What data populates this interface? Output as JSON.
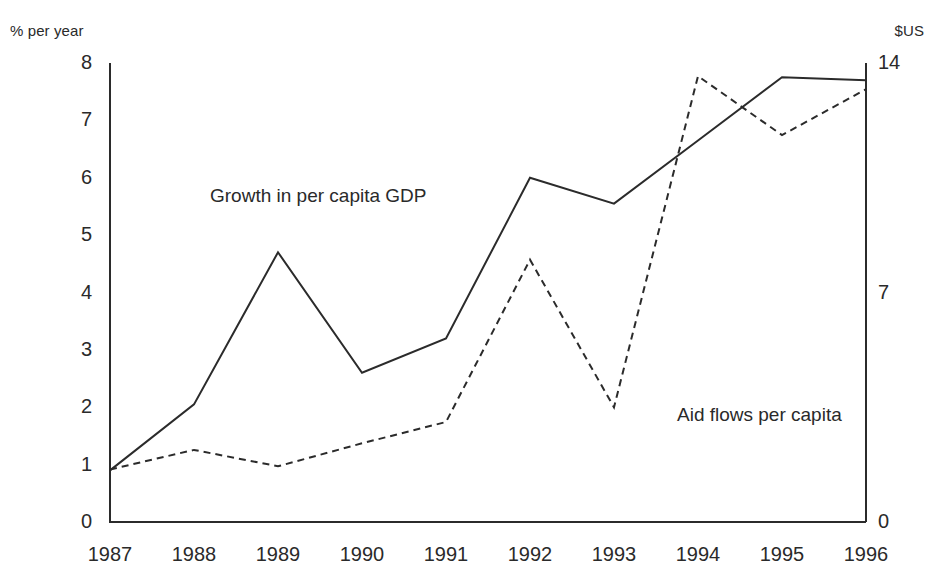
{
  "chart_data": {
    "type": "line",
    "title": "",
    "subtitle": "",
    "xlabel": "",
    "ylabel": "% per year",
    "y2label": "$US",
    "grid": false,
    "legend_position": "inline-annotations",
    "x": [
      "1987",
      "1988",
      "1989",
      "1990",
      "1991",
      "1992",
      "1993",
      "1994",
      "1995",
      "1996"
    ],
    "xtick_labels": [
      "1987",
      "1988",
      "1989",
      "1990",
      "1991",
      "1992",
      "1993",
      "1994",
      "1995",
      "1996"
    ],
    "ytick_labels_left": [
      "8",
      "7",
      "6",
      "5",
      "4",
      "3",
      "2",
      "1",
      "0"
    ],
    "ytick_values_left": [
      8,
      7,
      6,
      5,
      4,
      3,
      2,
      1,
      0
    ],
    "ytick_labels_right": [
      "14",
      "7",
      "0"
    ],
    "ytick_values_right": [
      14,
      7,
      0
    ],
    "ylim_left": [
      0,
      8
    ],
    "ylim_right": [
      0,
      14
    ],
    "series": [
      {
        "name": "Growth in per capita GDP",
        "axis": "left",
        "style": "solid",
        "unit": "% per year",
        "values": [
          0.9,
          2.05,
          4.7,
          2.6,
          3.2,
          6.0,
          5.55,
          6.65,
          7.75,
          7.7
        ]
      },
      {
        "name": "Aid flows per capita",
        "axis": "right",
        "style": "dashed",
        "unit": "$US",
        "values": [
          1.6,
          2.2,
          1.7,
          2.4,
          3.05,
          8.0,
          3.5,
          13.6,
          11.8,
          13.2
        ]
      }
    ],
    "annotations": [
      {
        "text": "Growth in per capita GDP",
        "x_frac": 0.225,
        "y_frac": 0.315
      },
      {
        "text": "Aid flows per capita",
        "x_frac": 0.725,
        "y_frac": 0.69
      }
    ]
  },
  "axis_units": {
    "left": "% per year",
    "right": "$US"
  },
  "colors": {
    "ink": "#2b2b2b",
    "background": "#ffffff"
  }
}
